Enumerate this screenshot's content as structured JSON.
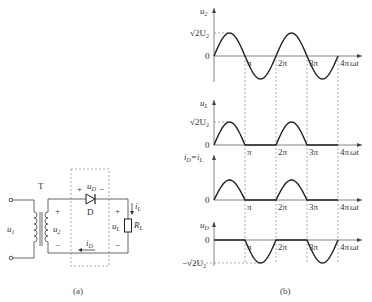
{
  "circuit": {
    "transformer_label": "T",
    "diode_label": "D",
    "input_voltage": {
      "main": "u",
      "sub": "1"
    },
    "secondary_voltage": {
      "main": "u",
      "sub": "2"
    },
    "diode_voltage": {
      "main": "u",
      "sub": "D"
    },
    "load_voltage": {
      "main": "u",
      "sub": "L"
    },
    "load_current": {
      "main": "i",
      "sub": "L"
    },
    "diode_current": {
      "main": "i",
      "sub": "D"
    },
    "load_resistor": {
      "main": "R",
      "sub": "L"
    },
    "plus": "+",
    "minus": "−",
    "caption": "(a)"
  },
  "waveforms": {
    "caption": "(b)",
    "x_ticks": [
      "π",
      "2π",
      "3π",
      "4π"
    ],
    "x_axis_label": "ωt",
    "zero_label": "0",
    "peak_label": "√2U₂",
    "neg_peak_label": "−√2U₂",
    "panels": [
      {
        "ylabel": {
          "main": "u",
          "sub": "2"
        },
        "kind": "full-sine",
        "show_peak": true
      },
      {
        "ylabel": {
          "main": "u",
          "sub": "L"
        },
        "kind": "positive-half",
        "show_peak": true
      },
      {
        "ylabel": {
          "main": "i",
          "sub": "D",
          "eq": "=i",
          "sub2": "L"
        },
        "kind": "positive-half",
        "show_peak": false
      },
      {
        "ylabel": {
          "main": "u",
          "sub": "D"
        },
        "kind": "negative-half",
        "show_neg_peak": true
      }
    ]
  },
  "chart_data": {
    "type": "line",
    "xlabel": "ωt",
    "x_ticks": [
      "0",
      "π",
      "2π",
      "3π",
      "4π"
    ],
    "xlim": [
      0,
      "4π"
    ],
    "series": [
      {
        "name": "u2",
        "shape": "sin(ωt)",
        "amplitude": "√2U₂"
      },
      {
        "name": "uL",
        "shape": "max(sin(ωt),0)",
        "amplitude": "√2U₂"
      },
      {
        "name": "iD = iL",
        "shape": "max(sin(ωt),0)"
      },
      {
        "name": "uD",
        "shape": "min(sin(ωt),0)",
        "amplitude": "−√2U₂"
      }
    ]
  }
}
